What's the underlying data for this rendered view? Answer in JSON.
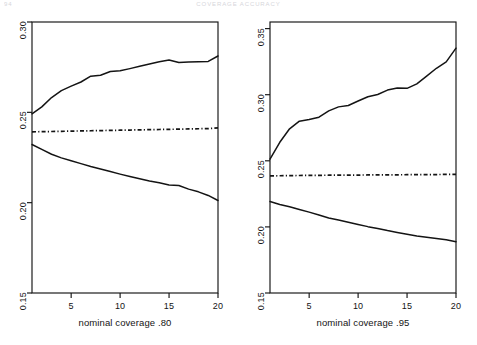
{
  "running_head": {
    "folio": "94",
    "title": "COVERAGE ACCURACY"
  },
  "chart_data": [
    {
      "type": "line",
      "panel_id": "left",
      "title": "",
      "xlabel": "nominal coverage .80",
      "ylabel": "",
      "xlim": [
        1,
        20
      ],
      "ylim": [
        0.15,
        0.3
      ],
      "xticks": [
        5,
        10,
        15,
        20
      ],
      "xticklabels": [
        "5",
        "10",
        "15",
        "20"
      ],
      "yticks": [
        0.15,
        0.2,
        0.25,
        0.3
      ],
      "yticklabels": [
        "0.15",
        "0.20",
        "0.25",
        "0.30"
      ],
      "grid": false,
      "legend": "none",
      "x": [
        1,
        2,
        3,
        4,
        5,
        6,
        7,
        8,
        9,
        10,
        11,
        12,
        13,
        14,
        15,
        16,
        17,
        18,
        19,
        20
      ],
      "series": [
        {
          "name": "upper",
          "style": "solid",
          "values": [
            0.2492,
            0.253,
            0.2582,
            0.262,
            0.2645,
            0.2668,
            0.27,
            0.2705,
            0.2726,
            0.273,
            0.2742,
            0.2755,
            0.2768,
            0.278,
            0.279,
            0.2776,
            0.2778,
            0.278,
            0.2782,
            0.2812
          ]
        },
        {
          "name": "middle",
          "style": "dash-dot",
          "values": [
            0.2392,
            0.2393,
            0.2394,
            0.2395,
            0.2396,
            0.2397,
            0.2398,
            0.2399,
            0.24,
            0.2401,
            0.2402,
            0.2403,
            0.2404,
            0.2405,
            0.2406,
            0.2407,
            0.2408,
            0.2409,
            0.241,
            0.2414
          ]
        },
        {
          "name": "lower",
          "style": "solid",
          "values": [
            0.2322,
            0.2295,
            0.2268,
            0.2248,
            0.2232,
            0.2216,
            0.22,
            0.2186,
            0.2172,
            0.2158,
            0.2145,
            0.2132,
            0.212,
            0.211,
            0.2098,
            0.2095,
            0.2075,
            0.206,
            0.204,
            0.2012
          ]
        }
      ]
    },
    {
      "type": "line",
      "panel_id": "right",
      "title": "",
      "xlabel": "nominal coverage .95",
      "ylabel": "",
      "xlim": [
        1,
        20
      ],
      "ylim": [
        0.15,
        0.355
      ],
      "xticks": [
        5,
        10,
        15,
        20
      ],
      "xticklabels": [
        "5",
        "10",
        "15",
        "20"
      ],
      "yticks": [
        0.15,
        0.2,
        0.25,
        0.3,
        0.35
      ],
      "yticklabels": [
        "0.15",
        "0.20",
        "0.25",
        "0.30",
        "0.35"
      ],
      "grid": false,
      "legend": "none",
      "x": [
        1,
        2,
        3,
        4,
        5,
        6,
        7,
        8,
        9,
        10,
        11,
        12,
        13,
        14,
        15,
        16,
        17,
        18,
        19,
        20
      ],
      "series": [
        {
          "name": "upper",
          "style": "solid",
          "values": [
            0.2512,
            0.264,
            0.2742,
            0.28,
            0.2812,
            0.283,
            0.2878,
            0.2908,
            0.2918,
            0.2952,
            0.2985,
            0.3002,
            0.3035,
            0.305,
            0.3048,
            0.3082,
            0.314,
            0.32,
            0.3248,
            0.3352
          ]
        },
        {
          "name": "middle",
          "style": "dash-dot",
          "values": [
            0.2386,
            0.2387,
            0.2388,
            0.2389,
            0.239,
            0.239,
            0.2391,
            0.2391,
            0.2392,
            0.2392,
            0.2393,
            0.2393,
            0.2394,
            0.2394,
            0.2395,
            0.2395,
            0.2396,
            0.2396,
            0.2397,
            0.2398
          ]
        },
        {
          "name": "lower",
          "style": "solid",
          "values": [
            0.2192,
            0.217,
            0.2152,
            0.2132,
            0.2112,
            0.209,
            0.2068,
            0.2052,
            0.2035,
            0.2018,
            0.2002,
            0.1988,
            0.1972,
            0.1958,
            0.1945,
            0.1932,
            0.1922,
            0.1912,
            0.1902,
            0.1888
          ]
        }
      ]
    }
  ]
}
